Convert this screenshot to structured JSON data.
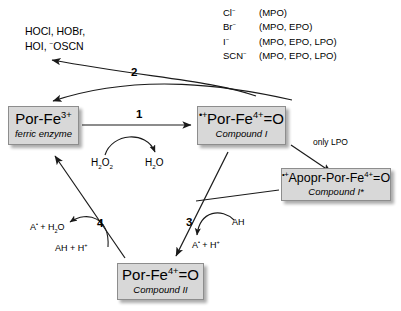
{
  "diagram": {
    "colors": {
      "node_fill": "#d8d8d8",
      "node_border": "#8d8d8d",
      "stroke": "#1a1a1a",
      "text": "#000000"
    }
  },
  "nodes": {
    "ferric": {
      "formula_html": "Por-Fe<sup>3+</sup>",
      "caption": "ferric enzyme"
    },
    "compound_i": {
      "formula_html": "<span class=\"rad\">&bull;+</span>Por-Fe<sup>4+</sup>=O",
      "caption": "Compound I"
    },
    "compound_i_star": {
      "formula_html": "<span class=\"rad\">&bull;+</span>Apopr-Por-Fe<sup>4+</sup>=O",
      "caption": "Compound I*"
    },
    "compound_ii": {
      "formula_html": "Por-Fe<sup>4+</sup>=O",
      "caption": "Compound II"
    }
  },
  "steps": {
    "step1": "1",
    "step2": "2",
    "step3": "3",
    "step4": "4"
  },
  "labels": {
    "products_line1": "HOCl, HOBr,",
    "products_line2_html": "HOI, <sup>&minus;</sup>OSCN",
    "only_lpo": "only LPO",
    "h2o2_html": "H<sub>2</sub>O<sub>2</sub>",
    "h2o_html": "H<sub>2</sub>O",
    "ah_step3": "AH",
    "a_radical_h_step3_html": "A<span class=\"rad\">&bull;</span> + H<sup>+</sup>",
    "a_radical_h2o_step4_html": "A<span class=\"rad\">&bull;</span> + H<sub>2</sub>O",
    "ah_h_step4_html": "AH + H<sup>+</sup>"
  },
  "halides": [
    {
      "ion_html": "Cl<sup>&minus;</sup>",
      "enzymes": "(MPO)"
    },
    {
      "ion_html": "Br<sup>&minus;</sup>",
      "enzymes": "(MPO, EPO)"
    },
    {
      "ion_html": "I<sup>&minus;</sup>",
      "enzymes": "(MPO, EPO, LPO)"
    },
    {
      "ion_html": "SCN<sup>&minus;</sup>",
      "enzymes": "(MPO, EPO, LPO)"
    }
  ]
}
